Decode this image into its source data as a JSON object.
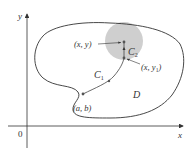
{
  "figure": {
    "axes": {
      "x_label": "x",
      "y_label": "y",
      "origin_label": "0"
    },
    "region": {
      "label": "D"
    },
    "disk": {
      "color": "#cfcfcf"
    },
    "curves": {
      "c1": {
        "label": "C",
        "sub": "1"
      },
      "c2": {
        "label": "C",
        "sub": "2"
      }
    },
    "points": {
      "start": {
        "label": "(a, b)"
      },
      "xy": {
        "label": "(x, y)"
      },
      "xy1": {
        "label_main": "(x, y",
        "label_sub": "1",
        "label_close": ")"
      }
    },
    "colors": {
      "line": "#333333",
      "disk": "#cfcfcf",
      "point": "#555555"
    }
  }
}
